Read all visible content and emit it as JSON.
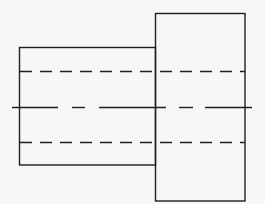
{
  "diagram": {
    "type": "orthographic-view",
    "colors": {
      "background": "#f7f7f5",
      "line": "#1e1e1e"
    },
    "line_width": 1.4,
    "shapes": {
      "small_step": {
        "x": 19.5,
        "y": 47.5,
        "width": 136,
        "height": 117.5
      },
      "large_step": {
        "x": 155.5,
        "y": 13.5,
        "width": 89.5,
        "height": 187.5
      }
    },
    "hidden_lines": [
      {
        "x1": 20,
        "y1": 71.5,
        "x2": 245,
        "y2": 71.5,
        "dash": "12 8"
      },
      {
        "x1": 20,
        "y1": 142.5,
        "x2": 245,
        "y2": 142.5,
        "dash": "12 8"
      }
    ],
    "centerline": {
      "y": 107.5,
      "segments": [
        [
          12,
          58
        ],
        [
          72,
          85
        ],
        [
          99,
          166
        ],
        [
          179,
          193
        ],
        [
          205,
          252
        ]
      ]
    }
  }
}
